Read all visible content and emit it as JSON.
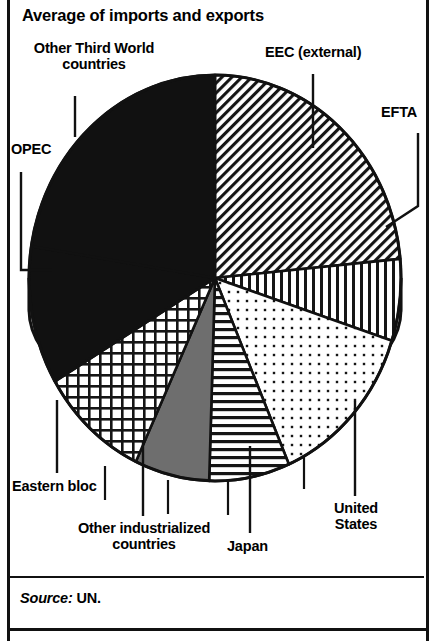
{
  "title": "Average of imports and exports",
  "source": {
    "prefix": "Source:",
    "value": "UN."
  },
  "labels": {
    "other_third_world": "Other Third World\ncountries",
    "other_third_world_line1": "Other Third World",
    "other_third_world_line2": "countries",
    "opec": "OPEC",
    "eec": "EEC (external)",
    "efta": "EFTA",
    "united_states_line1": "United",
    "united_states_line2": "States",
    "japan": "Japan",
    "other_industrialized_line1": "Other industrialized",
    "other_industrialized_line2": "countries",
    "eastern_bloc": "Eastern bloc"
  },
  "chart_data": {
    "type": "pie",
    "title": "Average of imports and exports",
    "xlabel": "",
    "ylabel": "",
    "grid": false,
    "legend": "callout-labels",
    "source": "Source: UN.",
    "units": "percent share",
    "start_angle_deg": 0,
    "direction": "clockwise",
    "categories": [
      "EEC (external)",
      "EFTA",
      "United States",
      "Japan",
      "Other industrialized countries",
      "Eastern bloc",
      "OPEC",
      "Other Third World countries"
    ],
    "values": [
      23.5,
      6.5,
      13.5,
      7.0,
      6.5,
      9.5,
      11.0,
      22.5
    ],
    "slices": [
      {
        "label": "EEC (external)",
        "value": 23.5,
        "fill": "diagonal-hatch",
        "color": "#ffffff",
        "stroke": "#111111",
        "start_deg": 0,
        "end_deg": 84.6
      },
      {
        "label": "EFTA",
        "value": 6.5,
        "fill": "vertical-hatch",
        "color": "#ffffff",
        "stroke": "#111111",
        "start_deg": 84.6,
        "end_deg": 108.0
      },
      {
        "label": "United States",
        "value": 13.5,
        "fill": "dot-stipple",
        "color": "#ffffff",
        "stroke": "#111111",
        "start_deg": 108.0,
        "end_deg": 156.6
      },
      {
        "label": "Japan",
        "value": 7.0,
        "fill": "horizontal-hatch",
        "color": "#ffffff",
        "stroke": "#111111",
        "start_deg": 156.6,
        "end_deg": 181.8
      },
      {
        "label": "Other industrialized countries",
        "value": 6.5,
        "fill": "solid-gray",
        "color": "#6e6e6e",
        "stroke": "#111111",
        "start_deg": 181.8,
        "end_deg": 205.2
      },
      {
        "label": "Eastern bloc",
        "value": 9.5,
        "fill": "cross-hatch",
        "color": "#ffffff",
        "stroke": "#111111",
        "start_deg": 205.2,
        "end_deg": 239.4
      },
      {
        "label": "OPEC",
        "value": 11.0,
        "fill": "solid-black",
        "color": "#111111",
        "stroke": "#111111",
        "start_deg": 239.4,
        "end_deg": 279.0
      },
      {
        "label": "Other Third World countries",
        "value": 22.5,
        "fill": "solid-black",
        "color": "#111111",
        "stroke": "#111111",
        "start_deg": 279.0,
        "end_deg": 360.0
      }
    ],
    "colors": {
      "ink": "#111111",
      "paper": "#ffffff",
      "gray_slice": "#6e6e6e",
      "rim": "#dcdcdc"
    }
  }
}
